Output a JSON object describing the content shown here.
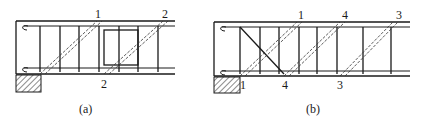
{
  "figure": {
    "panel_a": {
      "caption": "(a)",
      "labels": {
        "top_1": "1",
        "top_2": "2",
        "bottom_2": "2"
      }
    },
    "panel_b": {
      "caption": "(b)",
      "labels": {
        "top_1": "1",
        "top_4": "4",
        "top_3": "3",
        "bottom_1": "1",
        "bottom_4": "4",
        "bottom_3": "3"
      }
    }
  }
}
